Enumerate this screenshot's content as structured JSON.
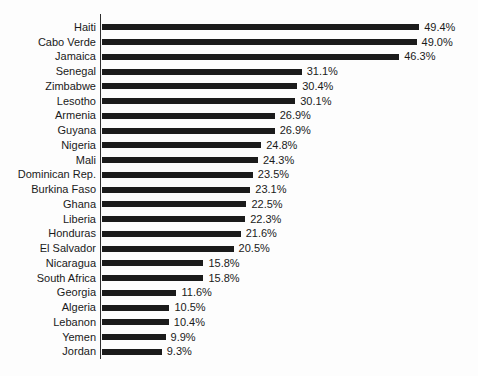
{
  "chart_data": {
    "type": "bar",
    "orientation": "horizontal",
    "title": "",
    "xlabel": "",
    "ylabel": "",
    "grid": false,
    "legend": false,
    "xlim": [
      0,
      50
    ],
    "bar_color": "#1b1b1b",
    "axis_color": "#2e2e2e",
    "text_color": "#1a1a1a",
    "value_suffix": "%",
    "categories": [
      "Haiti",
      "Cabo Verde",
      "Jamaica",
      "Senegal",
      "Zimbabwe",
      "Lesotho",
      "Armenia",
      "Guyana",
      "Nigeria",
      "Mali",
      "Dominican Rep.",
      "Burkina Faso",
      "Ghana",
      "Liberia",
      "Honduras",
      "El Salvador",
      "Nicaragua",
      "South Africa",
      "Georgia",
      "Algeria",
      "Lebanon",
      "Yemen",
      "Jordan"
    ],
    "values": [
      49.4,
      49.0,
      46.3,
      31.1,
      30.4,
      30.1,
      26.9,
      26.9,
      24.8,
      24.3,
      23.5,
      23.1,
      22.5,
      22.3,
      21.6,
      20.5,
      15.8,
      15.8,
      11.6,
      10.5,
      10.4,
      9.9,
      9.3
    ],
    "value_labels": [
      "49.4%",
      "49.0%",
      "46.3%",
      "31.1%",
      "30.4%",
      "30.1%",
      "26.9%",
      "26.9%",
      "24.8%",
      "24.3%",
      "23.5%",
      "23.1%",
      "22.5%",
      "22.3%",
      "21.6%",
      "20.5%",
      "15.8%",
      "15.8%",
      "11.6%",
      "10.5%",
      "10.4%",
      "9.9%",
      "9.3%"
    ]
  }
}
